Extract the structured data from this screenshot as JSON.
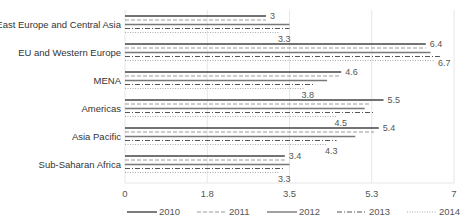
{
  "chart_data": {
    "type": "bar",
    "orientation": "horizontal",
    "title": "",
    "xlabel": "",
    "ylabel": "",
    "xlim": [
      0,
      7
    ],
    "x_ticks": [
      0,
      1.75,
      3.5,
      5.25,
      7
    ],
    "x_tick_labels": [
      "0",
      "1.8",
      "3.5",
      "5.3",
      "7"
    ],
    "grid": true,
    "legend_position": "bottom",
    "categories": [
      "East Europe and Central Asia",
      "EU and Western Europe",
      "MENA",
      "Americas",
      "Asia Pacific",
      "Sub-Saharan Africa"
    ],
    "series": [
      {
        "name": "2010",
        "style": "solid",
        "color": "#444444",
        "values": [
          3.0,
          6.4,
          4.6,
          5.5,
          5.4,
          3.4
        ]
      },
      {
        "name": "2011",
        "style": "dashed",
        "color": "#999999",
        "values": [
          3.0,
          6.4,
          4.6,
          5.2,
          5.3,
          3.4
        ]
      },
      {
        "name": "2012",
        "style": "solid",
        "color": "#777777",
        "values": [
          3.5,
          6.5,
          4.3,
          5.1,
          4.9,
          3.5
        ]
      },
      {
        "name": "2013",
        "style": "dashdot",
        "color": "#555555",
        "values": [
          3.5,
          6.7,
          4.0,
          5.3,
          4.5,
          3.4
        ]
      },
      {
        "name": "2014",
        "style": "dotted",
        "color": "#aaaaaa",
        "values": [
          3.3,
          6.6,
          3.8,
          4.5,
          4.3,
          3.3
        ]
      }
    ],
    "annotations": [
      {
        "category": "East Europe and Central Asia",
        "series": "2010",
        "text": "3"
      },
      {
        "category": "East Europe and Central Asia",
        "series": "2014",
        "text": "3.3"
      },
      {
        "category": "EU and Western Europe",
        "series": "2010",
        "text": "6.4"
      },
      {
        "category": "EU and Western Europe",
        "series": "2013",
        "text": "6.7"
      },
      {
        "category": "MENA",
        "series": "2010",
        "text": "4.6"
      },
      {
        "category": "MENA",
        "series": "2014",
        "text": "3.8"
      },
      {
        "category": "Americas",
        "series": "2010",
        "text": "5.5"
      },
      {
        "category": "Americas",
        "series": "2014",
        "text": "4.5"
      },
      {
        "category": "Asia Pacific",
        "series": "2010",
        "text": "5.4"
      },
      {
        "category": "Asia Pacific",
        "series": "2014",
        "text": "4.3"
      },
      {
        "category": "Sub-Saharan Africa",
        "series": "2010",
        "text": "3.4"
      },
      {
        "category": "Sub-Saharan Africa",
        "series": "2014",
        "text": "3.3"
      }
    ]
  },
  "title_fragment": "Regional Average Rating by Year"
}
